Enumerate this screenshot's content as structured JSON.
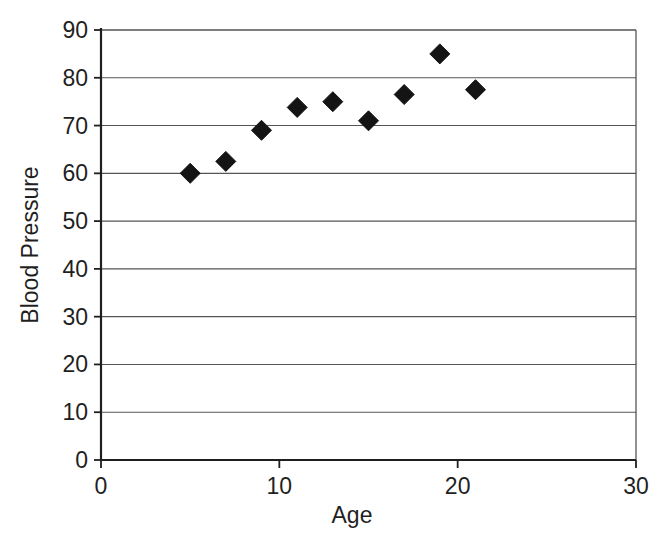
{
  "chart_data": {
    "type": "scatter",
    "title": "",
    "xlabel": "Age",
    "ylabel": "Blood Pressure",
    "xlim": [
      0,
      30
    ],
    "ylim": [
      0,
      90
    ],
    "xticks": [
      0,
      10,
      20,
      30
    ],
    "yticks": [
      0,
      10,
      20,
      30,
      40,
      50,
      60,
      70,
      80,
      90
    ],
    "xtick_labels": [
      "0",
      "10",
      "20",
      "30"
    ],
    "ytick_labels": [
      "0",
      "10",
      "20",
      "30",
      "40",
      "50",
      "60",
      "70",
      "80",
      "90"
    ],
    "grid": "horizontal",
    "legend": "none",
    "marker": "diamond",
    "marker_color": "#141414",
    "series": [
      {
        "name": "Blood Pressure vs Age",
        "x": [
          5,
          7,
          9,
          11,
          13,
          15,
          17,
          19,
          21
        ],
        "y": [
          60,
          62.5,
          69,
          73.8,
          75,
          71,
          76.5,
          85,
          77.5
        ]
      }
    ]
  },
  "axes": {
    "x_title": "Age",
    "y_title": "Blood Pressure"
  },
  "colors": {
    "background": "#ffffff",
    "ink": "#1f1f1f",
    "grid": "#555555",
    "marker": "#141414"
  },
  "caption": {
    "partial_text": ""
  }
}
